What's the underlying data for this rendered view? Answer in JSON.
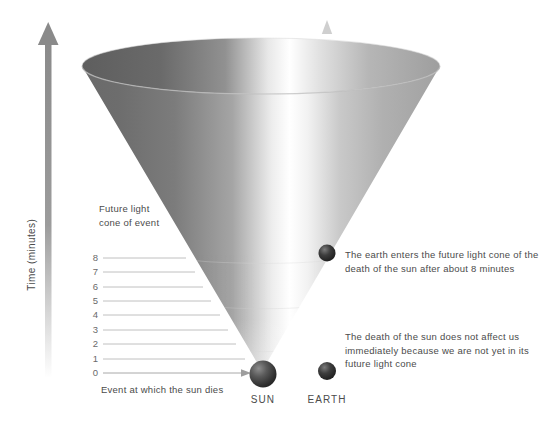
{
  "figure": {
    "title": "Future light cone of the death of the sun",
    "background_color": "#ffffff"
  },
  "axis": {
    "label": "Time (minutes)",
    "arrow_color": "#8a8a8a",
    "tick_label_color": "#6a6a6a",
    "ticks": [
      {
        "value": "8",
        "y": 258
      },
      {
        "value": "7",
        "y": 272
      },
      {
        "value": "6",
        "y": 287
      },
      {
        "value": "5",
        "y": 301
      },
      {
        "value": "4",
        "y": 315
      },
      {
        "value": "3",
        "y": 330
      },
      {
        "value": "2",
        "y": 344
      },
      {
        "value": "1",
        "y": 359
      },
      {
        "value": "0",
        "y": 373
      }
    ]
  },
  "cone": {
    "name": "future-light-cone",
    "label": "Future light\ncone of event",
    "fill_dark": "#6f6f6f",
    "fill_light": "#ffffff",
    "rim_color": "#9a9a9a"
  },
  "annotations": {
    "event": "Event at which the sun dies",
    "earth_enters": "The earth enters the future light cone of the\ndeath of the sun after about 8 minutes",
    "no_affect": "The death of the sun does not affect us\nimmediately because we are not yet in its\nfuture light cone"
  },
  "bodies": [
    {
      "name": "sun",
      "label": "SUN",
      "color": "#3a3a3a"
    },
    {
      "name": "earth",
      "label": "EARTH",
      "color": "#2e2e2e"
    }
  ],
  "worldline": {
    "name": "earth-worldline",
    "color": "#c8c8c8"
  },
  "chart_data": {
    "type": "diagram",
    "title": "Future light cone of event",
    "ylabel": "Time (minutes)",
    "ytick_labels": [
      "0",
      "1",
      "2",
      "3",
      "4",
      "5",
      "6",
      "7",
      "8"
    ],
    "ylim": [
      0,
      8
    ],
    "grid": true,
    "annotations": [
      "Future light cone of event",
      "Event at which the sun dies",
      "The earth enters the future light cone of the death of the sun after about 8 minutes",
      "The death of the sun does not affect us immediately because we are not yet in its future light cone"
    ],
    "markers": [
      {
        "label": "SUN",
        "time_minutes": 0,
        "note": "Event at which the sun dies"
      },
      {
        "label": "EARTH",
        "time_minutes": 0,
        "note": "not yet in the future light cone"
      },
      {
        "label": "EARTH",
        "time_minutes": 8,
        "note": "enters the future light cone"
      }
    ]
  }
}
